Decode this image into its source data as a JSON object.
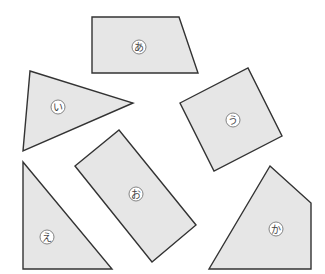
{
  "figure": {
    "background": "#ffffff",
    "fill_color": "#e6e6e6",
    "stroke_color": "#333333",
    "shapes": [
      {
        "id": "a",
        "label": "あ",
        "kind": "trapezoid",
        "points": "92,17 179,17 198,73 92,73",
        "label_pos": [
          139,
          47
        ]
      },
      {
        "id": "i",
        "label": "い",
        "kind": "triangle",
        "points": "30,71 133,103 23,151",
        "label_pos": [
          58,
          107
        ]
      },
      {
        "id": "u",
        "label": "う",
        "kind": "square",
        "points": "180,103 248,68 282,136 214,171",
        "label_pos": [
          233,
          120
        ]
      },
      {
        "id": "e",
        "label": "え",
        "kind": "right-triangle",
        "points": "23,162 112,269 23,269",
        "label_pos": [
          47,
          237
        ]
      },
      {
        "id": "o",
        "label": "お",
        "kind": "rectangle",
        "points": "75,166 119,130 196,225 152,262",
        "label_pos": [
          136,
          194
        ]
      },
      {
        "id": "ka",
        "label": "か",
        "kind": "pentagon",
        "points": "270,166 311,203 311,269 209,269",
        "label_pos": [
          276,
          229
        ]
      }
    ]
  }
}
